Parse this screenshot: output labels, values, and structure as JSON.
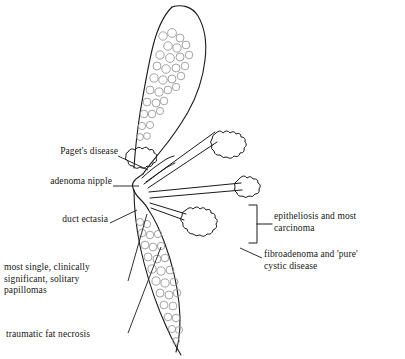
{
  "figure": {
    "title_present": false,
    "background_color": "#ffffff",
    "line_color": "#1a1a1a",
    "duct_color": "#8f8f8f"
  },
  "labels": [
    {
      "id": "pagets-disease",
      "text": "Paget's disease",
      "x": 31,
      "y": 151,
      "align": "left"
    },
    {
      "id": "adenoma-nipple",
      "text": "adenoma nipple",
      "x": 26,
      "y": 181,
      "align": "left"
    },
    {
      "id": "duct-ectasia",
      "text": "duct ectasia",
      "x": 48,
      "y": 219,
      "align": "left"
    },
    {
      "id": "epitheliosis-carcinoma",
      "text": "epitheliosis and most\ncarcinoma",
      "x": 274,
      "y": 216,
      "align": "left"
    },
    {
      "id": "fibroadenoma-cystic",
      "text": "fibroadenoma and 'pure'\ncystic disease",
      "x": 264,
      "y": 254,
      "align": "left"
    },
    {
      "id": "papillomas",
      "text": "most single, clinically\nsignificant, solitary\npapillomas",
      "x": 4,
      "y": 267,
      "align": "left"
    },
    {
      "id": "traumatic-fat-necrosis",
      "text": "traumatic fat necrosis",
      "x": 6,
      "y": 334,
      "align": "left"
    }
  ],
  "leader_lines": [
    {
      "id": "leader-pagets-disease",
      "from": [
        118,
        156
      ],
      "to": [
        146,
        170
      ]
    },
    {
      "id": "leader-adenoma-nipple",
      "from": [
        113,
        186
      ],
      "to": [
        139,
        186
      ]
    },
    {
      "id": "leader-duct-ectasia",
      "from": [
        110,
        223
      ],
      "to": [
        136,
        209
      ]
    },
    {
      "id": "leader-epitheliosis",
      "from": [
        272,
        224
      ],
      "to": [
        249,
        224
      ]
    },
    {
      "id": "leader-fibroadenoma",
      "from": [
        262,
        258
      ],
      "to": [
        241,
        247
      ]
    },
    {
      "id": "leader-papillomas",
      "from": [
        128,
        281
      ],
      "to": [
        146,
        213
      ]
    },
    {
      "id": "leader-traumatic",
      "from": [
        128,
        333
      ],
      "to": [
        160,
        246
      ]
    }
  ]
}
